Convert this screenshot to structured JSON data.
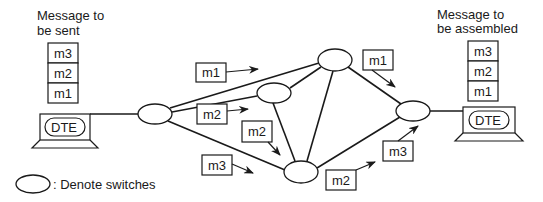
{
  "diagram": {
    "title_left": [
      "Message to",
      "be sent"
    ],
    "title_right": [
      "Message to",
      "be assembled"
    ],
    "stack_left": [
      "m3",
      "m2",
      "m1"
    ],
    "stack_right": [
      "m3",
      "m2",
      "m1"
    ],
    "dte_left_label": "DTE",
    "dte_right_label": "DTE",
    "legend_text": ": Denote switches",
    "switches": [
      {
        "id": "s1",
        "cx": 155,
        "cy": 114
      },
      {
        "id": "s_mid",
        "cx": 274,
        "cy": 93
      },
      {
        "id": "s_top",
        "cx": 335,
        "cy": 60
      },
      {
        "id": "s_bot",
        "cx": 301,
        "cy": 172
      },
      {
        "id": "s_right",
        "cx": 413,
        "cy": 111
      }
    ],
    "packets": [
      {
        "label": "m1",
        "box": [
          196,
          63
        ],
        "arrow": "to s_top path"
      },
      {
        "label": "m2",
        "box": [
          197,
          104
        ],
        "arrow": "to s_mid path"
      },
      {
        "label": "m2",
        "box": [
          242,
          121
        ],
        "arrow": "down to s_bot"
      },
      {
        "label": "m3",
        "box": [
          202,
          155
        ],
        "arrow": "to s_bot path"
      },
      {
        "label": "m1",
        "box": [
          363,
          50
        ],
        "arrow": "to s_right"
      },
      {
        "label": "m2",
        "box": [
          326,
          170
        ],
        "arrow": "to s_right"
      },
      {
        "label": "m3",
        "box": [
          383,
          141
        ],
        "arrow": "to s_right"
      }
    ],
    "packet_labels": [
      "m1",
      "m2",
      "m2",
      "m3",
      "m1",
      "m2",
      "m3"
    ],
    "colors": {
      "stroke": "#1a1a1a",
      "background": "#ffffff"
    }
  }
}
